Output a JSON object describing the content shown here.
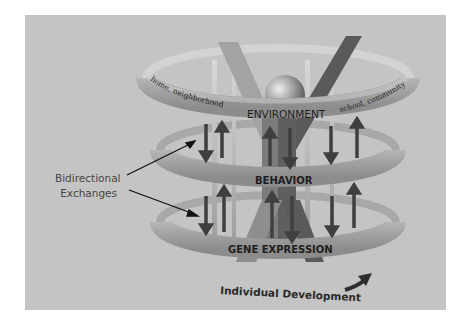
{
  "diagram": {
    "rings": [
      {
        "id": "environment",
        "label": "ENVIRONMENT",
        "left_text": "home, neighborhood",
        "right_text": "school, community"
      },
      {
        "id": "behavior",
        "label": "BEHAVIOR"
      },
      {
        "id": "gene_expression",
        "label": "GENE EXPRESSION"
      }
    ],
    "callout": {
      "line1": "Bidirectional",
      "line2": "Exchanges"
    },
    "timeline": {
      "label": "Individual Development"
    },
    "colors": {
      "background_panel": "#c4c4c4",
      "ring": "#9a9a9a",
      "ring_light": "#b8b8b8",
      "arrows": "#4a4a4a",
      "figure": "#6e6e6e",
      "text": "#1e1e1e"
    }
  }
}
